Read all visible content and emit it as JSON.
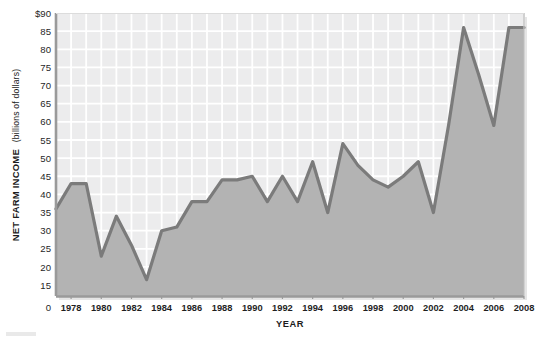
{
  "chart_data": {
    "type": "area",
    "title": "",
    "subtitle": "",
    "xlabel": "YEAR",
    "ylabel": "NET FARM INCOME (billions of dollars)",
    "ylabel_main": "NET FARM INCOME",
    "ylabel_units": "(billions of dollars)",
    "grid": true,
    "legend": "none",
    "xlim": [
      1977,
      2008
    ],
    "ylim": [
      12,
      90
    ],
    "y_ticks": [
      "$90",
      "85",
      "80",
      "75",
      "70",
      "65",
      "60",
      "55",
      "50",
      "45",
      "40",
      "35",
      "30",
      "25",
      "20",
      "15"
    ],
    "y_tick_values": [
      90,
      85,
      80,
      75,
      70,
      65,
      60,
      55,
      50,
      45,
      40,
      35,
      30,
      25,
      20,
      15
    ],
    "y_origin_label": "0",
    "x_ticks": [
      "1978",
      "1980",
      "1982",
      "1984",
      "1986",
      "1988",
      "1990",
      "1992",
      "1994",
      "1996",
      "1998",
      "2000",
      "2002",
      "2004",
      "2006",
      "2008"
    ],
    "x_tick_values": [
      1978,
      1980,
      1982,
      1984,
      1986,
      1988,
      1990,
      1992,
      1994,
      1996,
      1998,
      2000,
      2002,
      2004,
      2006,
      2008
    ],
    "x": [
      1977,
      1978,
      1979,
      1980,
      1981,
      1982,
      1983,
      1984,
      1985,
      1986,
      1987,
      1988,
      1989,
      1990,
      1991,
      1992,
      1993,
      1994,
      1995,
      1996,
      1997,
      1998,
      1999,
      2000,
      2001,
      2002,
      2003,
      2004,
      2005,
      2006,
      2007,
      2008
    ],
    "values": [
      36,
      43,
      43,
      23,
      34,
      26,
      16.5,
      30,
      31,
      38,
      38,
      44,
      44,
      45,
      38,
      45,
      38,
      49,
      35,
      54,
      48,
      44,
      42,
      45,
      49,
      35,
      59,
      86,
      73,
      59,
      86,
      86
    ],
    "series": [
      {
        "name": "Net farm income",
        "values": [
          36,
          43,
          43,
          23,
          34,
          26,
          16.5,
          30,
          31,
          38,
          38,
          44,
          44,
          45,
          38,
          45,
          38,
          49,
          35,
          54,
          48,
          44,
          42,
          45,
          49,
          35,
          59,
          86,
          73,
          59,
          86,
          86
        ]
      }
    ],
    "colors": {
      "line": "#7b7b7b",
      "fill": "#b3b3b3",
      "plot_background": "#ececed",
      "grid": "#ffffff",
      "axis": "#8c8c8c",
      "text": "#1f1f1f"
    }
  }
}
